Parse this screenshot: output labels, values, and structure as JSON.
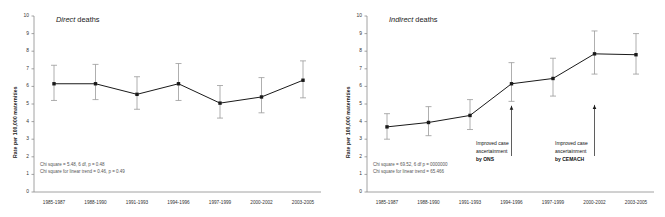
{
  "figure": {
    "width": 665,
    "height": 217,
    "background": "#ffffff",
    "line_color": "#1a1a1a",
    "marker_color": "#1a1a1a",
    "errorbar_color": "#9a9a9a",
    "axis_color": "#8c8c8c"
  },
  "chart_data": [
    {
      "type": "line",
      "title_emphasis": "Direct",
      "title_rest": " deaths",
      "title": "Direct deaths",
      "xlabel": "",
      "ylabel": "Rate per 100,000 maternities",
      "ylim": [
        0,
        10
      ],
      "ytick_values": [
        0,
        1,
        2,
        3,
        4,
        5,
        6,
        7,
        8,
        9,
        10
      ],
      "ytick_labels": [
        "0",
        "1",
        "2",
        "3",
        "4",
        "5",
        "6",
        "7",
        "8",
        "9",
        "10"
      ],
      "grid": false,
      "legend": "none",
      "categories": [
        "1985-1987",
        "1988-1990",
        "1991-1993",
        "1994-1996",
        "1997-1999",
        "2000-2002",
        "2003-2005"
      ],
      "values": [
        6.15,
        6.15,
        5.55,
        6.15,
        5.05,
        5.4,
        6.35
      ],
      "ci_lower": [
        5.2,
        5.25,
        4.7,
        5.2,
        4.2,
        4.5,
        5.35
      ],
      "ci_upper": [
        7.2,
        7.25,
        6.55,
        7.3,
        6.05,
        6.5,
        7.45
      ],
      "annotations": [
        {
          "id": "chi-square",
          "text": "Chi square = 5.48, 6 df, p = 0.48"
        },
        {
          "id": "chi-square-linear-trend",
          "text": "Chi square for linear trend = 0.46, p = 0.49"
        }
      ]
    },
    {
      "type": "line",
      "title_emphasis": "Indirect",
      "title_rest": " deaths",
      "title": "Indirect deaths",
      "xlabel": "",
      "ylabel": "Rate per 100,000 maternities",
      "ylim": [
        0,
        10
      ],
      "ytick_values": [
        0,
        1,
        2,
        3,
        4,
        5,
        6,
        7,
        8,
        9,
        10
      ],
      "ytick_labels": [
        "0",
        "1",
        "2",
        "3",
        "4",
        "5",
        "6",
        "7",
        "8",
        "9",
        "10"
      ],
      "grid": false,
      "legend": "none",
      "categories": [
        "1985-1987",
        "1988-1990",
        "1991-1993",
        "1994-1996",
        "1997-1999",
        "2000-2002",
        "2003-2005"
      ],
      "values": [
        3.7,
        3.95,
        4.35,
        6.15,
        6.45,
        7.85,
        7.8
      ],
      "ci_lower": [
        3.0,
        3.2,
        3.55,
        5.15,
        5.45,
        6.7,
        6.7
      ],
      "ci_upper": [
        4.45,
        4.85,
        5.25,
        7.35,
        7.6,
        9.15,
        9.0
      ],
      "annotations": [
        {
          "id": "chi-square",
          "text": "Chi square = 69.52, 6 df p = 0000000"
        },
        {
          "id": "chi-square-linear-trend",
          "text": "Chi square for linear trend = 65.466"
        }
      ],
      "callouts": [
        {
          "id": "ons-callout",
          "at_category": "1994-1996",
          "arrow_tip_value": 4.9,
          "line1": "Improved case",
          "line2": "ascertainment",
          "line3": "by ONS"
        },
        {
          "id": "cemach-callout",
          "at_category": "2000-2002",
          "arrow_tip_value": 4.95,
          "line1": "Improved case",
          "line2": "ascertainment",
          "line3": "by CEMACH"
        }
      ]
    }
  ]
}
